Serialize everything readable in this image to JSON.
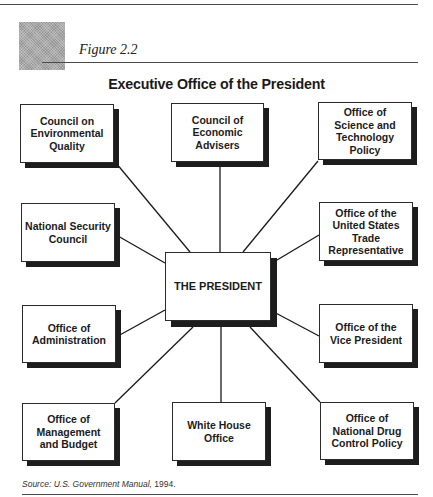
{
  "figure": {
    "label": "Figure 2.2",
    "title": "Executive Office of the President",
    "source_prefix": "Source: ",
    "source_title": "U.S. Government Manual,",
    "source_year": " 1994."
  },
  "colors": {
    "line": "#1a1a1a",
    "shadow": "#1d1d1d",
    "box_fill": "#ffffff",
    "accent_square": "#a8a8a8"
  },
  "nodes": {
    "president": "THE PRESIDENT",
    "ceq": "Council on\nEnvironmental\nQuality",
    "cea": "Council of\nEconomic\nAdvisers",
    "ostp": "Office of\nScience and\nTechnology\nPolicy",
    "nsc": "National Security\nCouncil",
    "ustr": "Office of the\nUnited States\nTrade\nRepresentative",
    "oa": "Office of\nAdministration",
    "ovp": "Office of the\nVice President",
    "omb": "Office of\nManagement\nand Budget",
    "who": "White House\nOffice",
    "ondcp": "Office of\nNational Drug\nControl Policy"
  },
  "edges": [
    {
      "from": "ceq",
      "to": "president"
    },
    {
      "from": "cea",
      "to": "president"
    },
    {
      "from": "ostp",
      "to": "president"
    },
    {
      "from": "nsc",
      "to": "president"
    },
    {
      "from": "ustr",
      "to": "president"
    },
    {
      "from": "oa",
      "to": "president"
    },
    {
      "from": "ovp",
      "to": "president"
    },
    {
      "from": "omb",
      "to": "president"
    },
    {
      "from": "who",
      "to": "president"
    },
    {
      "from": "ondcp",
      "to": "president"
    }
  ]
}
